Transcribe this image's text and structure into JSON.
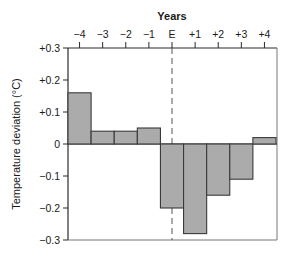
{
  "chart_data": {
    "type": "bar",
    "title": "",
    "xlabel": "Years",
    "ylabel": "Temperature deviation (°C)",
    "categories": [
      "−4",
      "−3",
      "−2",
      "−1",
      "E",
      "+1",
      "+2",
      "+3",
      "+4"
    ],
    "values": [
      0.16,
      0.04,
      0.04,
      0.05,
      -0.2,
      -0.28,
      -0.16,
      -0.11,
      0.02
    ],
    "ylim": [
      -0.3,
      0.3
    ],
    "yticks": [
      0.3,
      0.2,
      0.1,
      0,
      -0.1,
      -0.2,
      -0.3
    ],
    "ytick_labels": [
      "+0.3",
      "+0.2",
      "+0.1",
      "0",
      "−0.1",
      "−0.2",
      "−0.3"
    ],
    "xaxis_position": "top",
    "grid": false,
    "legend": null,
    "annotations": [
      {
        "type": "dashed-vertical-line",
        "at": "E"
      }
    ],
    "colors": {
      "bar_fill": "#ababab",
      "bar_stroke": "#3a3a3a",
      "axis": "#2a2a2a"
    }
  }
}
